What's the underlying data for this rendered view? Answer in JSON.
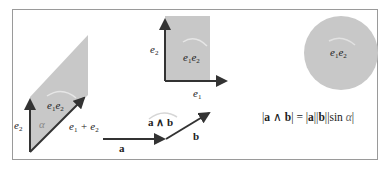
{
  "figure": {
    "colors": {
      "fill": "#c8c8c8",
      "stroke": "#333333",
      "frame": "#9a9a9a",
      "orientation_arc": "#e6e6e6"
    }
  },
  "parallelogram": {
    "label_area": "e1e2",
    "label_left_vector": "e2",
    "label_diag_vector": "e1 + e2",
    "label_angle": "α"
  },
  "square": {
    "label_area": "e1e2",
    "label_vertical": "e2",
    "label_horizontal": "e1"
  },
  "wedge": {
    "label_a": "a",
    "label_b": "b",
    "label_wedge": "a ∧ b"
  },
  "circle": {
    "label_area": "e1e2"
  },
  "formula": {
    "parts": [
      "|",
      "a",
      " ∧ ",
      "b",
      "| = |",
      "a",
      "||",
      "b",
      "||sin ",
      "α",
      "|"
    ]
  }
}
